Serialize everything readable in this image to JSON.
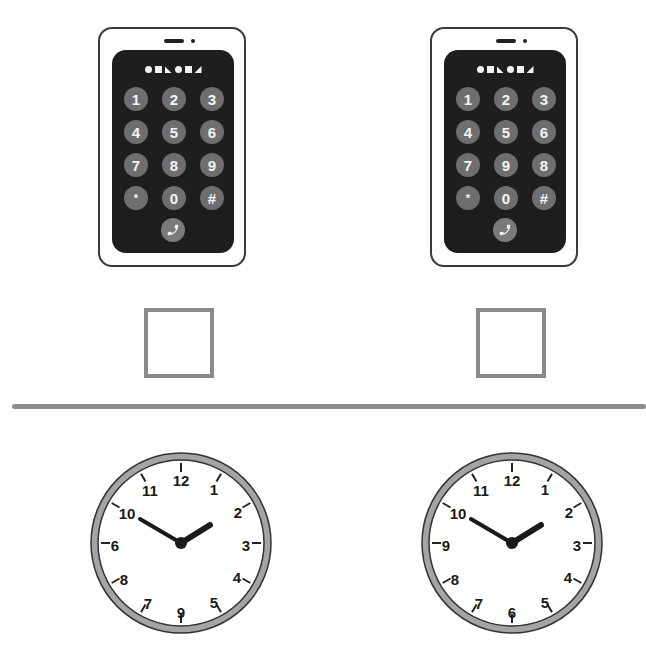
{
  "colors": {
    "phone_screen": "#1e1e1e",
    "key_fill": "#6e6e6e",
    "key_text": "#f4f4f4",
    "checkbox_border": "#8a8a8a",
    "divider": "#8c8c8c",
    "clock_rim": "#a0a0a0",
    "clock_hands": "#1a1a1a"
  },
  "phones": [
    {
      "id": "left",
      "shape_strip": [
        "circle",
        "square",
        "triangle-bottom-left",
        "circle",
        "square",
        "triangle-bottom-right"
      ],
      "keys": [
        "1",
        "2",
        "3",
        "4",
        "5",
        "6",
        "7",
        "8",
        "9",
        "*",
        "0",
        "#"
      ],
      "call_icon": "phone-handset-icon"
    },
    {
      "id": "right",
      "shape_strip": [
        "circle",
        "square",
        "triangle-bottom-left",
        "circle",
        "square",
        "triangle-bottom-right"
      ],
      "keys": [
        "1",
        "2",
        "3",
        "4",
        "5",
        "6",
        "7",
        "9",
        "8",
        "*",
        "0",
        "#"
      ],
      "call_icon": "phone-handset-icon"
    }
  ],
  "checkboxes": [
    {
      "id": "left",
      "checked": false
    },
    {
      "id": "right",
      "checked": false
    }
  ],
  "clocks": [
    {
      "id": "left",
      "numbers": [
        "12",
        "1",
        "2",
        "3",
        "4",
        "5",
        "9",
        "7",
        "8",
        "6",
        "10",
        "11"
      ],
      "time_shown": "1:50"
    },
    {
      "id": "right",
      "numbers": [
        "12",
        "1",
        "2",
        "3",
        "4",
        "5",
        "6",
        "7",
        "8",
        "9",
        "10",
        "11"
      ],
      "time_shown": "1:50"
    }
  ]
}
